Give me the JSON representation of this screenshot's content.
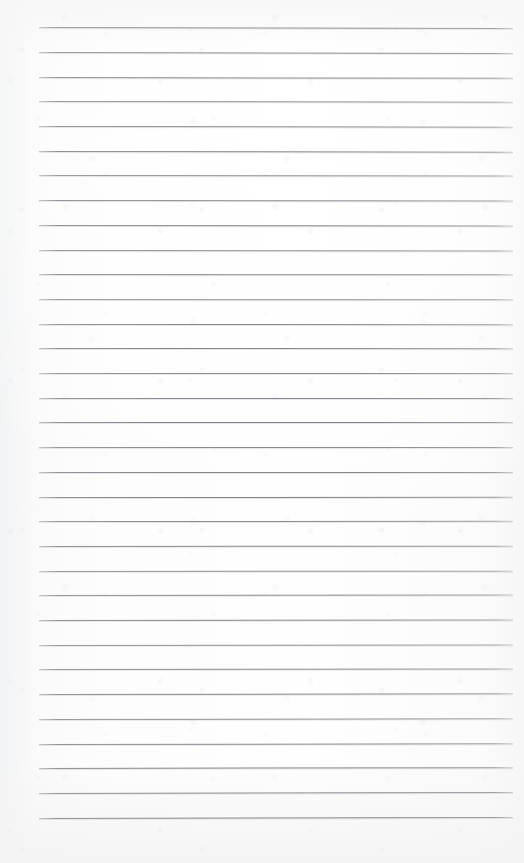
{
  "document": {
    "kind": "scanned-lined-paper",
    "title": "Blank ruled notepad page",
    "text_content": "",
    "handwriting": "",
    "page_number": "",
    "notes": "No printed or handwritten text is visible on the page."
  },
  "paper": {
    "background_color": "#fcfcfc",
    "edge_tint_color": "#f2f3f4",
    "width": 524,
    "height": 863
  },
  "ruling": {
    "line_color": "#7a7c83",
    "line_count": 33,
    "first_line_y": 27.2,
    "line_spacing": 24.7,
    "line_start_x": 39,
    "line_end_x": 513,
    "tilt_degrees": 0.12,
    "line_thickness": 1
  }
}
